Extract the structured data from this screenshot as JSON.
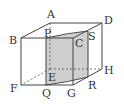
{
  "diagram": {
    "colors": {
      "line": "#444444",
      "shade": "#c8c8c8",
      "hidden": "#555555"
    },
    "vertices": {
      "A": [
        50,
        23
      ],
      "D": [
        102,
        23
      ],
      "B": [
        21,
        38
      ],
      "C": [
        73,
        38
      ],
      "E": [
        50,
        69
      ],
      "H": [
        102,
        69
      ],
      "F": [
        21,
        85
      ],
      "G": [
        73,
        85
      ],
      "P": [
        46,
        38
      ],
      "S": [
        88,
        31
      ],
      "Q": [
        46,
        85
      ],
      "R": [
        88,
        77
      ]
    },
    "labels": {
      "A": "A",
      "B": "B",
      "C": "C",
      "D": "D",
      "E": "E",
      "F": "F",
      "G": "G",
      "H": "H",
      "P": "P",
      "Q": "Q",
      "R": "R",
      "S": "S"
    }
  }
}
